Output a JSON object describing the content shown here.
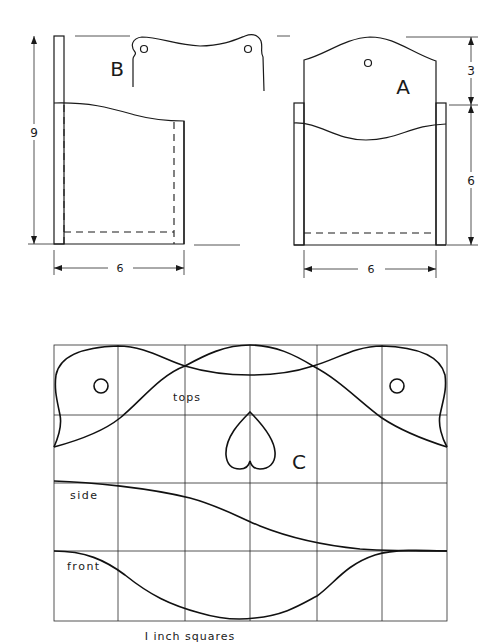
{
  "figure": {
    "title": "",
    "views": {
      "B": {
        "label": "B",
        "dim_height": "9",
        "dim_width": "6"
      },
      "A": {
        "label": "A",
        "dim_top": "3",
        "dim_lower": "6",
        "dim_width": "6"
      }
    },
    "pattern": {
      "label": "C",
      "grid_columns": 6,
      "grid_rows": 4,
      "labels": {
        "tops": "tops",
        "side": "side",
        "front": "front"
      },
      "caption": "I inch squares"
    }
  }
}
